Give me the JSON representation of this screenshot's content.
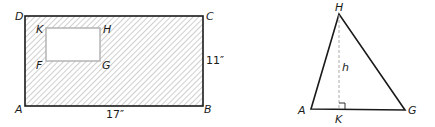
{
  "figure_left": {
    "outer_rectangle": {
      "vertices": {
        "A": "A",
        "B": "B",
        "C": "C",
        "D": "D"
      },
      "width_label": "17″",
      "height_label": "11″",
      "fill": "diagonal-hatch"
    },
    "inner_rectangle": {
      "vertices": {
        "K": "K",
        "H": "H",
        "F": "F",
        "G": "G"
      },
      "fill": "white"
    }
  },
  "figure_right": {
    "triangle": {
      "vertices": {
        "H": "H",
        "A": "A",
        "G": "G"
      }
    },
    "altitude": {
      "label": "h",
      "foot": "K",
      "style": "dashed",
      "right_angle_marker": true
    }
  },
  "colors": {
    "line": "#1a1a1a",
    "hatch": "#9a9a9a",
    "inner_border": "#b0b0b0",
    "dashed": "#aaaaaa"
  }
}
